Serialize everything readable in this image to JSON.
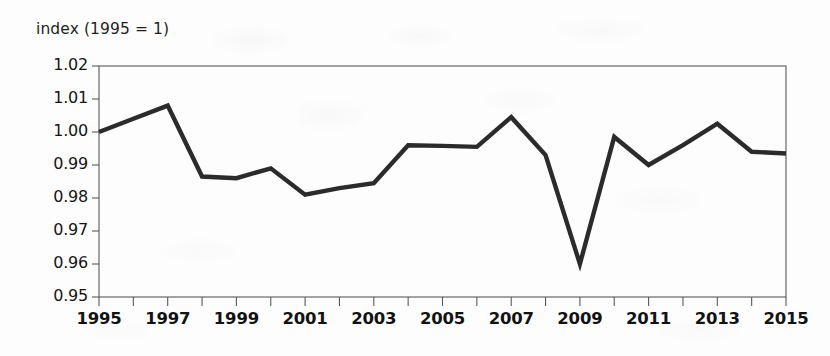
{
  "chart_data": {
    "type": "line",
    "title": "index (1995 = 1)",
    "xlabel": "",
    "ylabel": "index (1995 = 1)",
    "x": [
      1995,
      1996,
      1997,
      1998,
      1999,
      2000,
      2001,
      2002,
      2003,
      2004,
      2005,
      2006,
      2007,
      2008,
      2009,
      2010,
      2011,
      2012,
      2013,
      2014,
      2015
    ],
    "values": [
      1.0,
      1.004,
      1.008,
      0.9865,
      0.986,
      0.989,
      0.981,
      0.983,
      0.9845,
      0.996,
      0.9958,
      0.9955,
      1.0045,
      0.993,
      0.96,
      0.9985,
      0.99,
      0.996,
      1.0025,
      0.994,
      0.9935
    ],
    "series": [
      {
        "name": "index",
        "values": [
          1.0,
          1.004,
          1.008,
          0.9865,
          0.986,
          0.989,
          0.981,
          0.983,
          0.9845,
          0.996,
          0.9958,
          0.9955,
          1.0045,
          0.993,
          0.96,
          0.9985,
          0.99,
          0.996,
          1.0025,
          0.994,
          0.9935
        ]
      }
    ],
    "ylim": [
      0.95,
      1.02
    ],
    "xlim": [
      1995,
      2015
    ],
    "ytick_labels": [
      "1.02",
      "1.01",
      "1.00",
      "0.99",
      "0.98",
      "0.97",
      "0.96",
      "0.95"
    ],
    "ytick_values": [
      1.02,
      1.01,
      1.0,
      0.99,
      0.98,
      0.97,
      0.96,
      0.95
    ],
    "xtick_labels": [
      "1995",
      "1997",
      "1999",
      "2001",
      "2003",
      "2005",
      "2007",
      "2009",
      "2011",
      "2013",
      "2015"
    ],
    "xtick_values": [
      1995,
      1997,
      1999,
      2001,
      2003,
      2005,
      2007,
      2009,
      2011,
      2013,
      2015
    ],
    "xtick_minor_values": [
      1996,
      1998,
      2000,
      2002,
      2004,
      2006,
      2008,
      2010,
      2012,
      2014
    ],
    "grid": false,
    "legend": "none",
    "line_color": "#2b2b2b",
    "axis_color": "#5a5a5a",
    "background_color": "#fdfdfd"
  }
}
